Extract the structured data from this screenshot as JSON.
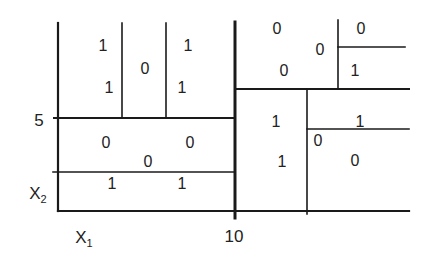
{
  "diagram": {
    "type": "recursive-partition",
    "axes": {
      "x_label": "X",
      "x_sub": "1",
      "y_label": "X",
      "y_sub": "2",
      "x_tick": "10",
      "y_tick": "5"
    },
    "cells": [
      {
        "id": "c1",
        "value": "1",
        "x": 103,
        "y": 46
      },
      {
        "id": "c2",
        "value": "1",
        "x": 109,
        "y": 88
      },
      {
        "id": "c3",
        "value": "0",
        "x": 145,
        "y": 69
      },
      {
        "id": "c4",
        "value": "1",
        "x": 188,
        "y": 46
      },
      {
        "id": "c5",
        "value": "1",
        "x": 182,
        "y": 88
      },
      {
        "id": "c6",
        "value": "0",
        "x": 106,
        "y": 143
      },
      {
        "id": "c7",
        "value": "0",
        "x": 148,
        "y": 162
      },
      {
        "id": "c8",
        "value": "0",
        "x": 190,
        "y": 143
      },
      {
        "id": "c9",
        "value": "1",
        "x": 112,
        "y": 184
      },
      {
        "id": "c10",
        "value": "1",
        "x": 182,
        "y": 184
      },
      {
        "id": "c11",
        "value": "0",
        "x": 277,
        "y": 29
      },
      {
        "id": "c12",
        "value": "0",
        "x": 320,
        "y": 50
      },
      {
        "id": "c13",
        "value": "0",
        "x": 284,
        "y": 71
      },
      {
        "id": "c14",
        "value": "0",
        "x": 361,
        "y": 29
      },
      {
        "id": "c15",
        "value": "1",
        "x": 355,
        "y": 71
      },
      {
        "id": "c16",
        "value": "1",
        "x": 276,
        "y": 122
      },
      {
        "id": "c17",
        "value": "1",
        "x": 282,
        "y": 162
      },
      {
        "id": "c18",
        "value": "1",
        "x": 360,
        "y": 122
      },
      {
        "id": "c19",
        "value": "0",
        "x": 318,
        "y": 141
      },
      {
        "id": "c20",
        "value": "0",
        "x": 355,
        "y": 161
      }
    ]
  }
}
